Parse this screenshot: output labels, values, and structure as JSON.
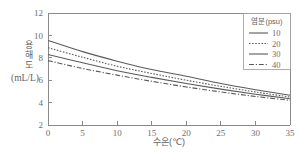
{
  "chart_data": {
    "type": "line",
    "title": "",
    "xlabel": "수온(℃)",
    "ylabel": "용해도 (mL/L)",
    "ylabel_lines": [
      "용",
      "해",
      "도"
    ],
    "ylabel_unit": "(mL/L)",
    "xlim": [
      0,
      35
    ],
    "ylim": [
      2,
      12
    ],
    "xticks": [
      0,
      5,
      10,
      15,
      20,
      25,
      30,
      35
    ],
    "yticks": [
      2,
      4,
      6,
      8,
      10,
      12
    ],
    "xtick_labels": [
      "0",
      "5",
      "10",
      "15",
      "20",
      "25",
      "30",
      "35"
    ],
    "ytick_labels": [
      "2",
      "4",
      "6",
      "8",
      "10",
      "12"
    ],
    "grid": false,
    "legend_position": "upper-right",
    "legend_title": "염분(psu)",
    "x": [
      0,
      5,
      10,
      15,
      20,
      25,
      30,
      35
    ],
    "series": [
      {
        "name": "10",
        "label": "10",
        "style": "solid",
        "color": "#5a5a5a",
        "values": [
          9.55,
          8.55,
          7.7,
          6.95,
          6.35,
          5.7,
          5.15,
          4.65
        ]
      },
      {
        "name": "20",
        "label": "20",
        "style": "dotted",
        "color": "#5a5a5a",
        "values": [
          8.9,
          8.05,
          7.25,
          6.6,
          6.0,
          5.45,
          4.95,
          4.5
        ]
      },
      {
        "name": "30",
        "label": "30",
        "style": "solid",
        "color": "#5a5a5a",
        "values": [
          8.3,
          7.55,
          6.85,
          6.25,
          5.7,
          5.2,
          4.75,
          4.35
        ]
      },
      {
        "name": "40",
        "label": "40",
        "style": "dashdot",
        "color": "#5a5a5a",
        "values": [
          7.75,
          7.05,
          6.45,
          5.9,
          5.4,
          4.95,
          4.55,
          4.2
        ]
      }
    ]
  },
  "legend": {
    "title": "염분(psu)",
    "entries": [
      {
        "label": "10",
        "style": "solid"
      },
      {
        "label": "20",
        "style": "dotted"
      },
      {
        "label": "30",
        "style": "solid"
      },
      {
        "label": "40",
        "style": "dashdot"
      }
    ]
  },
  "axes": {
    "x_title": "수온(℃)",
    "y_title_chars": [
      "용",
      "해",
      "도"
    ],
    "y_unit": "(mL/L)"
  },
  "colors": {
    "background": "#ffffff",
    "axis": "#8a8a8a",
    "line": "#5a5a5a",
    "text": "#6e6e6e"
  }
}
